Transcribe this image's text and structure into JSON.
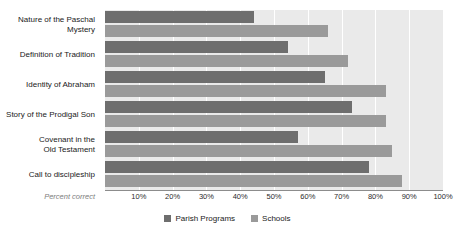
{
  "chart_data": {
    "type": "bar",
    "orientation": "horizontal",
    "title": "",
    "xlabel": "Percent correct",
    "ylabel": "",
    "xlim": [
      0,
      100
    ],
    "grid": true,
    "legend_position": "bottom",
    "categories": [
      "Nature of the Paschal Mystery",
      "Definition of Tradition",
      "Identity of Abraham",
      "Story of the Prodigal Son",
      "Covenant in the Old Testament",
      "Call to discipleship"
    ],
    "category_lines": [
      [
        "Nature of the Paschal",
        "Mystery"
      ],
      [
        "Definition of Tradition"
      ],
      [
        "Identity of Abraham"
      ],
      [
        "Story of the Prodigal Son"
      ],
      [
        "Covenant in the",
        "Old Testament"
      ],
      [
        "Call to discipleship"
      ]
    ],
    "series": [
      {
        "name": "Parish Programs",
        "color": "#6e6e6e",
        "values": [
          44,
          54,
          65,
          73,
          57,
          78
        ]
      },
      {
        "name": "Schools",
        "color": "#9a9a9a",
        "values": [
          66,
          72,
          83,
          83,
          85,
          88
        ]
      }
    ],
    "xticks": [
      10,
      20,
      30,
      40,
      50,
      60,
      70,
      80,
      90,
      100
    ],
    "xtick_labels": [
      "10%",
      "20%",
      "30%",
      "40%",
      "50%",
      "60%",
      "70%",
      "80%",
      "90%",
      "100%"
    ],
    "gridlines": [
      10,
      20,
      30,
      40,
      50,
      60,
      70,
      80,
      90,
      100
    ]
  },
  "axis": {
    "x_title": "Percent correct"
  },
  "legend": {
    "items": [
      {
        "label": "Parish Programs",
        "color": "#6e6e6e"
      },
      {
        "label": "Schools",
        "color": "#9a9a9a"
      }
    ]
  },
  "colors": {
    "plot_background": "#eaeaea",
    "page_background": "#ffffff",
    "gridline": "#ffffff",
    "axis_line": "#8c8c8c",
    "parish": "#6e6e6e",
    "schools": "#9a9a9a",
    "label_text": "#1a1a1a",
    "axis_title_text": "#7d7d7d"
  }
}
